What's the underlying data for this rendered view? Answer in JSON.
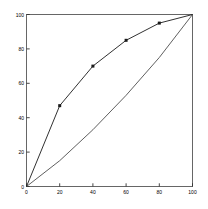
{
  "chart_data": {
    "type": "line",
    "title": "",
    "subtitle": "",
    "xlabel": "",
    "ylabel": "",
    "xlim": [
      0,
      100
    ],
    "ylim": [
      0,
      100
    ],
    "grid": false,
    "legend": "none",
    "xticks": [
      0,
      20,
      40,
      60,
      80,
      100
    ],
    "yticks": [
      0,
      20,
      40,
      60,
      80,
      100
    ],
    "xtick_labels": [
      "0",
      "20",
      "40",
      "60",
      "80",
      "100"
    ],
    "ytick_labels": [
      "0",
      "20",
      "40",
      "60",
      "80",
      "100"
    ],
    "series": [
      {
        "name": "upper-curve",
        "marker": "square",
        "color": "#1a1a1a",
        "x": [
          0,
          20,
          40,
          60,
          80,
          100
        ],
        "y": [
          0,
          47,
          70,
          85,
          95,
          100
        ]
      },
      {
        "name": "lower-curve",
        "marker": "none",
        "color": "#4d4d4d",
        "x": [
          0,
          20,
          40,
          60,
          80,
          100
        ],
        "y": [
          0,
          15,
          33,
          53,
          75,
          100
        ]
      }
    ]
  },
  "axes": {
    "frame_color": "#555555",
    "tick_color": "#333333",
    "label_color": "#000000"
  }
}
